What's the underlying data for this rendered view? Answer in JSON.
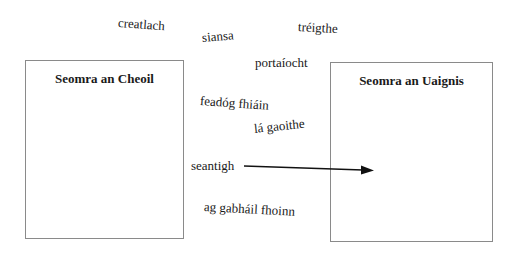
{
  "boxes": {
    "left": {
      "title": "Seomra an Cheoil"
    },
    "right": {
      "title": "Seomra an Uaignis"
    }
  },
  "words": [
    {
      "id": "creatlach",
      "text": "creatlach"
    },
    {
      "id": "siansa",
      "text": "siansa"
    },
    {
      "id": "treigthe",
      "text": "tréigthe"
    },
    {
      "id": "portaiocht",
      "text": "portaíocht"
    },
    {
      "id": "feadog-fhiain",
      "text": "feadóg fhiáin"
    },
    {
      "id": "la-gaoithe",
      "text": "lá gaoithe"
    },
    {
      "id": "seantigh",
      "text": "seantigh"
    },
    {
      "id": "ag-gabhail-fhoinn",
      "text": "ag gabháil fhoinn"
    }
  ],
  "arrow": {
    "from": "seantigh",
    "to": "Seomra an Uaignis",
    "color": "#111111"
  }
}
